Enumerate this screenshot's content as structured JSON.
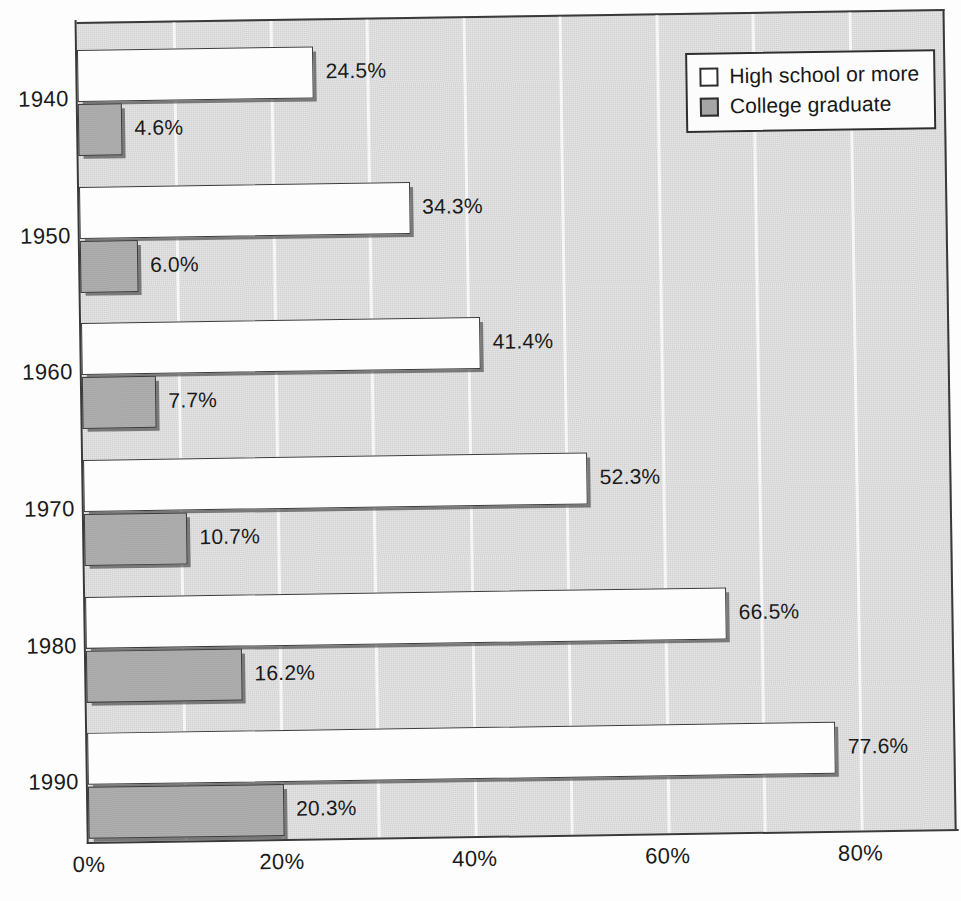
{
  "chart_data": {
    "type": "bar",
    "orientation": "horizontal",
    "title": "",
    "subtitle": "",
    "xlabel": "",
    "ylabel": "",
    "categories": [
      "1940",
      "1950",
      "1960",
      "1970",
      "1980",
      "1990"
    ],
    "series": [
      {
        "name": "High school or more",
        "key": "hs",
        "color": "#ffffff",
        "values": [
          24.5,
          34.3,
          41.4,
          52.3,
          66.5,
          77.6
        ],
        "labels": [
          "24.5%",
          "34.3%",
          "41.4%",
          "52.3%",
          "66.5%",
          "77.6%"
        ]
      },
      {
        "name": "College graduate",
        "key": "cg",
        "color": "#a6a6a6",
        "values": [
          4.6,
          6.0,
          7.7,
          10.7,
          16.2,
          20.3
        ],
        "labels": [
          "4.6%",
          "6.0%",
          "7.7%",
          "10.7%",
          "16.2%",
          "20.3%"
        ]
      }
    ],
    "xlim": [
      0,
      90
    ],
    "xticks": [
      0,
      20,
      40,
      60,
      80
    ],
    "xtick_labels": [
      "0%",
      "20%",
      "40%",
      "60%",
      "80%"
    ],
    "gridlines_every": 10,
    "grid": true,
    "grid_color": "#f7f7f7",
    "plot_background": "#d2d2d2",
    "legend": {
      "position": "top-right",
      "entries": [
        {
          "label": "High school or more",
          "swatch": "hollow-square"
        },
        {
          "label": "College graduate",
          "swatch": "filled-gray-square"
        }
      ]
    }
  }
}
